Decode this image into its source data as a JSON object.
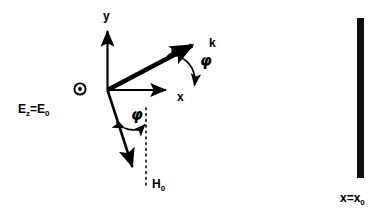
{
  "figure": {
    "type": "physics-diagram",
    "background_color": "#ffffff",
    "stroke_color": "#000000"
  },
  "axes": {
    "y_label": "y",
    "x_label": "x",
    "origin": {
      "x": 107,
      "y": 90
    }
  },
  "vectors": {
    "k": {
      "label": "k",
      "tip": {
        "x": 197,
        "y": 42
      }
    },
    "h": {
      "label_main": "H",
      "label_sub": "0",
      "tip": {
        "x": 137,
        "y": 172
      }
    }
  },
  "angles": {
    "upper": {
      "label": "φ"
    },
    "lower": {
      "label": "φ"
    }
  },
  "fields": {
    "e_out_of_page_icon": "circle-dot-icon",
    "e_label_lhs": "E",
    "e_label_lhs_sub": "z",
    "e_label_eq": "=E",
    "e_label_rhs_sub": "0"
  },
  "boundary": {
    "label_main": "x=x",
    "label_sub": "0",
    "bar_color": "#0d0d0d",
    "bar": {
      "x": 357,
      "y": 18,
      "width": 7,
      "height": 160
    }
  }
}
